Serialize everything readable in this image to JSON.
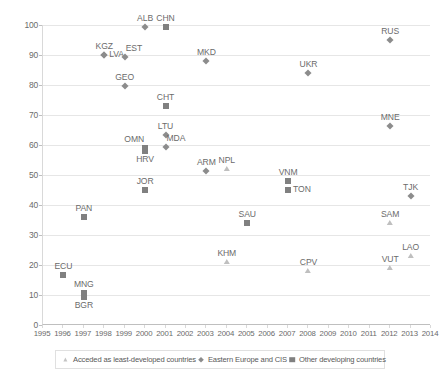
{
  "chart_data": {
    "type": "scatter",
    "title": "",
    "subtitle": "",
    "xlabel": "",
    "ylabel": "",
    "xlim": [
      1995,
      2014
    ],
    "ylim": [
      0,
      100
    ],
    "xticks": [
      1995,
      1996,
      1997,
      1998,
      1999,
      2000,
      2001,
      2002,
      2003,
      2004,
      2005,
      2006,
      2007,
      2008,
      2009,
      2010,
      2011,
      2012,
      2013,
      2014
    ],
    "yticks": [
      0,
      10,
      20,
      30,
      40,
      50,
      60,
      70,
      80,
      90,
      100
    ],
    "grid": "horizontal",
    "legend_position": "bottom",
    "series": [
      {
        "name": "Acceded as least-developed countries",
        "marker": "triangle",
        "color": "#bfbfbf",
        "points": [
          {
            "label": "NPL",
            "x": 2004,
            "y": 52,
            "label_pos": "top"
          },
          {
            "label": "KHM",
            "x": 2004,
            "y": 21,
            "label_pos": "top"
          },
          {
            "label": "CPV",
            "x": 2008,
            "y": 18,
            "label_pos": "top"
          },
          {
            "label": "SAM",
            "x": 2012,
            "y": 34,
            "label_pos": "top"
          },
          {
            "label": "VUT",
            "x": 2012,
            "y": 19,
            "label_pos": "top"
          },
          {
            "label": "LAO",
            "x": 2013,
            "y": 23,
            "label_pos": "top"
          }
        ]
      },
      {
        "name": "Eastern Europe and CIS",
        "marker": "diamond",
        "color": "#8c8c8c",
        "points": [
          {
            "label": "KGZ",
            "x": 1998,
            "y": 90,
            "label_pos": "top"
          },
          {
            "label": "LVA",
            "x": 1998,
            "y": 90,
            "label_pos": "right-inline"
          },
          {
            "label": "EST",
            "x": 1999,
            "y": 89.5,
            "label_pos": "topright"
          },
          {
            "label": "GEO",
            "x": 1999,
            "y": 79.7,
            "label_pos": "top"
          },
          {
            "label": "ALB",
            "x": 2000,
            "y": 99.5,
            "label_pos": "top"
          },
          {
            "label": "MKD",
            "x": 2003,
            "y": 88,
            "label_pos": "top"
          },
          {
            "label": "LTU",
            "x": 2001,
            "y": 63.5,
            "label_pos": "top"
          },
          {
            "label": "MDA",
            "x": 2001,
            "y": 59.2,
            "label_pos": "topright"
          },
          {
            "label": "ARM",
            "x": 2003,
            "y": 51.5,
            "label_pos": "top"
          },
          {
            "label": "UKR",
            "x": 2008,
            "y": 84,
            "label_pos": "top"
          },
          {
            "label": "MNE",
            "x": 2012,
            "y": 66.5,
            "label_pos": "top"
          },
          {
            "label": "RUS",
            "x": 2012,
            "y": 95,
            "label_pos": "top"
          },
          {
            "label": "TJK",
            "x": 2013,
            "y": 43,
            "label_pos": "top"
          }
        ]
      },
      {
        "name": "Other developing countries",
        "marker": "square",
        "color": "#808080",
        "points": [
          {
            "label": "ECU",
            "x": 1996,
            "y": 16.7,
            "label_pos": "top"
          },
          {
            "label": "MNG",
            "x": 1997,
            "y": 10.8,
            "label_pos": "top"
          },
          {
            "label": "BGR",
            "x": 1997,
            "y": 9.5,
            "label_pos": "bottom"
          },
          {
            "label": "PAN",
            "x": 1997,
            "y": 36,
            "label_pos": "top"
          },
          {
            "label": "CHN",
            "x": 2001,
            "y": 99.5,
            "label_pos": "top"
          },
          {
            "label": "CHT",
            "x": 2001,
            "y": 73,
            "label_pos": "top"
          },
          {
            "label": "OMN",
            "x": 2000,
            "y": 59,
            "label_pos": "topleft"
          },
          {
            "label": "HRV",
            "x": 2000,
            "y": 58,
            "label_pos": "bottom"
          },
          {
            "label": "JOR",
            "x": 2000,
            "y": 45,
            "label_pos": "top"
          },
          {
            "label": "SAU",
            "x": 2005,
            "y": 34,
            "label_pos": "top"
          },
          {
            "label": "VNM",
            "x": 2007,
            "y": 48,
            "label_pos": "top"
          },
          {
            "label": "TON",
            "x": 2007,
            "y": 45,
            "label_pos": "right"
          }
        ]
      }
    ]
  },
  "axis": {
    "y_labels": [
      "100",
      "90",
      "80",
      "70",
      "60",
      "50",
      "40",
      "30",
      "20",
      "10",
      "0"
    ],
    "x_labels": [
      "1995",
      "1996",
      "1997",
      "1998",
      "1999",
      "2000",
      "2001",
      "2002",
      "2003",
      "2004",
      "2005",
      "2006",
      "2007",
      "2008",
      "2009",
      "2010",
      "2011",
      "2012",
      "2013",
      "2014"
    ]
  },
  "legend": {
    "items": [
      {
        "label": "Acceded as least-developed countries",
        "marker": "triangle"
      },
      {
        "label": "Eastern Europe and CIS",
        "marker": "diamond"
      },
      {
        "label": "Other developing countries",
        "marker": "square"
      }
    ]
  }
}
